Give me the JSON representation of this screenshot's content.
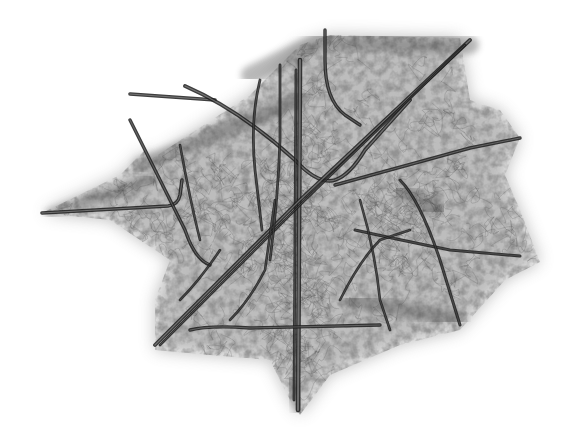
{
  "artwork": {
    "title": "",
    "background": "#ffffff",
    "haze_color": "#6e6e6e",
    "rod_color": "#2a2a2a",
    "scribble_color": "#555555",
    "haze_outline": [
      [
        150,
        160
      ],
      [
        250,
        95
      ],
      [
        300,
        45
      ],
      [
        330,
        35
      ],
      [
        460,
        38
      ],
      [
        470,
        100
      ],
      [
        500,
        110
      ],
      [
        520,
        138
      ],
      [
        505,
        175
      ],
      [
        520,
        210
      ],
      [
        540,
        262
      ],
      [
        505,
        280
      ],
      [
        460,
        330
      ],
      [
        400,
        345
      ],
      [
        330,
        375
      ],
      [
        300,
        415
      ],
      [
        290,
        400
      ],
      [
        270,
        360
      ],
      [
        210,
        355
      ],
      [
        155,
        350
      ],
      [
        155,
        300
      ],
      [
        170,
        260
      ],
      [
        110,
        220
      ],
      [
        42,
        213
      ],
      [
        120,
        175
      ],
      [
        145,
        150
      ]
    ],
    "dark_bands": [
      {
        "d": "M250 75 L320 40 L470 45",
        "width": 18
      },
      {
        "d": "M140 165 L250 120 L300 100",
        "width": 14
      },
      {
        "d": "M400 190 L440 210",
        "width": 16
      },
      {
        "d": "M290 380 L300 410",
        "width": 12
      },
      {
        "d": "M50 213 L150 180",
        "width": 10
      },
      {
        "d": "M350 300 L460 320",
        "width": 14
      }
    ],
    "rods": [
      {
        "d": "M42 213 L168 206 Q178 205 180 195 L182 180",
        "w": 2.2
      },
      {
        "d": "M130 94 L215 100",
        "w": 2.2
      },
      {
        "d": "M185 86 Q240 110 295 160 Q318 185 335 180 Q350 175 365 150 L410 100",
        "w": 2.4
      },
      {
        "d": "M300 60 L298 410",
        "w": 3.2
      },
      {
        "d": "M296 70 L294 400",
        "w": 1.4
      },
      {
        "d": "M155 345 L300 200 L470 40",
        "w": 2.4
      },
      {
        "d": "M160 345 L305 200 L465 45",
        "w": 1.2
      },
      {
        "d": "M335 185 L470 148 L520 138",
        "w": 2.0
      },
      {
        "d": "M355 230 Q400 240 450 250 L520 256",
        "w": 1.6
      },
      {
        "d": "M190 330 Q210 325 250 328 L380 325",
        "w": 2.0
      },
      {
        "d": "M130 120 L185 230 Q195 260 210 265",
        "w": 2.0
      },
      {
        "d": "M400 180 Q420 200 440 260 L460 325",
        "w": 1.6
      },
      {
        "d": "M325 30 L325 60 Q325 100 345 115 L360 125",
        "w": 2.0
      },
      {
        "d": "M280 65 L280 140 Q278 200 270 260",
        "w": 1.4
      },
      {
        "d": "M180 145 Q190 200 200 240",
        "w": 1.2
      },
      {
        "d": "M230 320 Q250 300 265 270 L275 200",
        "w": 1.2
      },
      {
        "d": "M340 300 Q360 260 380 240 L410 230",
        "w": 1.2
      },
      {
        "d": "M260 80 Q250 120 255 170 L262 230",
        "w": 1.4
      },
      {
        "d": "M360 200 Q375 250 380 300 L390 330",
        "w": 1.2
      },
      {
        "d": "M180 300 Q200 280 220 250",
        "w": 1.2
      }
    ]
  }
}
